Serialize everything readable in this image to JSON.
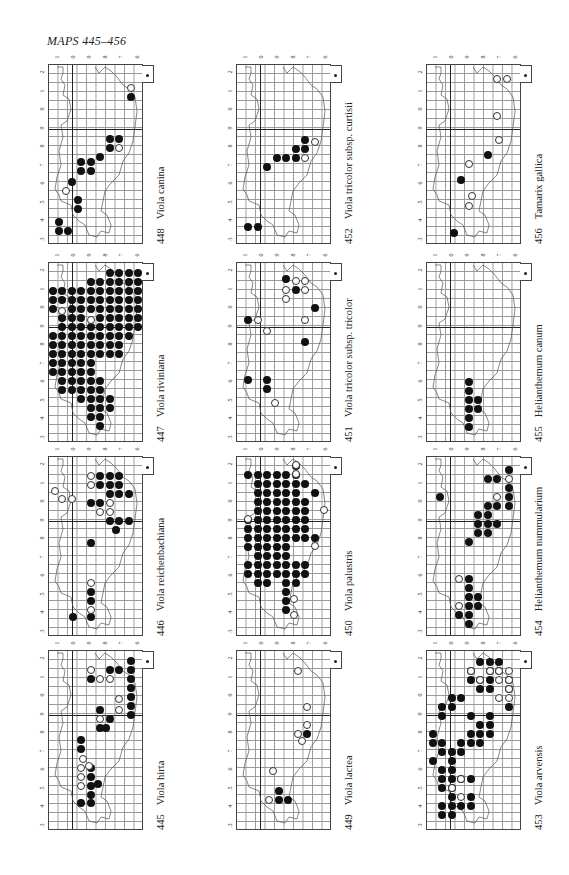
{
  "page": {
    "title": "MAPS 445–456",
    "background": "#ffffff",
    "dot_color": "#111111"
  },
  "axis_ticks": {
    "left": [
      "2",
      "1",
      "0",
      "9",
      "8",
      "7",
      "6",
      "5",
      "4",
      "3"
    ],
    "top": [
      "1",
      "0",
      "9",
      "8",
      "7",
      "6"
    ]
  },
  "legend": {
    "filled": "record present (filled circle)",
    "open": "older record (open circle)"
  },
  "maps": [
    {
      "number": "448",
      "species": "Viola canina",
      "col": 0,
      "row": 0,
      "filled": [
        [
          8.6,
          3.5
        ],
        [
          7.4,
          8.2
        ],
        [
          6.4,
          8.2
        ],
        [
          6.4,
          9.2
        ],
        [
          5.4,
          10.2
        ],
        [
          4.4,
          10.8
        ],
        [
          4.4,
          11.8
        ],
        [
          3.4,
          11.8
        ],
        [
          3.4,
          10.8
        ],
        [
          2.4,
          13.0
        ],
        [
          3.0,
          15.0
        ],
        [
          3.0,
          16.0
        ],
        [
          1.0,
          17.4
        ],
        [
          1.0,
          18.4
        ],
        [
          2.0,
          18.4
        ]
      ],
      "open": [
        [
          8.6,
          2.6
        ],
        [
          7.4,
          9.2
        ],
        [
          1.8,
          14.0
        ]
      ]
    },
    {
      "number": "447",
      "species": "Viola riviniana",
      "col": 0,
      "row": 1,
      "filled": "dense",
      "open": [
        [
          1.4,
          5.3
        ],
        [
          4.4,
          6.3
        ]
      ]
    },
    {
      "number": "446",
      "species": "Viola reichenbachiana",
      "col": 0,
      "row": 2,
      "filled": [
        [
          5.4,
          2.1
        ],
        [
          6.4,
          2.1
        ],
        [
          7.4,
          2.1
        ],
        [
          5.4,
          3.1
        ],
        [
          6.4,
          3.1
        ],
        [
          7.4,
          3.1
        ],
        [
          6.4,
          4.1
        ],
        [
          7.4,
          4.1
        ],
        [
          8.4,
          4.1
        ],
        [
          4.4,
          5.1
        ],
        [
          5.4,
          5.1
        ],
        [
          6.4,
          7.1
        ],
        [
          7.4,
          7.1
        ],
        [
          8.4,
          7.1
        ],
        [
          7.0,
          8.1
        ],
        [
          4.4,
          9.5
        ],
        [
          4.4,
          15.0
        ],
        [
          4.4,
          16.0
        ],
        [
          2.5,
          17.8
        ],
        [
          4.4,
          17.8
        ]
      ],
      "open": [
        [
          4.4,
          2.1
        ],
        [
          4.4,
          3.1
        ],
        [
          0.6,
          3.8
        ],
        [
          1.4,
          4.7
        ],
        [
          2.4,
          4.7
        ],
        [
          6.4,
          5.1
        ],
        [
          5.4,
          6.1
        ],
        [
          6.4,
          6.1
        ],
        [
          4.4,
          14.0
        ],
        [
          4.4,
          17.0
        ]
      ]
    },
    {
      "number": "445",
      "species": "Viola hirta",
      "col": 0,
      "row": 3,
      "filled": [
        [
          8.6,
          1.1
        ],
        [
          6.4,
          2.1
        ],
        [
          7.4,
          2.1
        ],
        [
          8.6,
          2.1
        ],
        [
          4.4,
          3.1
        ],
        [
          8.6,
          3.1
        ],
        [
          8.6,
          4.1
        ],
        [
          8.6,
          5.1
        ],
        [
          8.6,
          6.1
        ],
        [
          5.4,
          6.5
        ],
        [
          8.6,
          7.1
        ],
        [
          6.4,
          7.5
        ],
        [
          5.4,
          8.5
        ],
        [
          6.0,
          8.5
        ],
        [
          3.4,
          9.9
        ],
        [
          3.4,
          10.9
        ],
        [
          4.4,
          13.0
        ],
        [
          4.4,
          14.0
        ],
        [
          5.2,
          14.8
        ],
        [
          4.4,
          15.0
        ],
        [
          4.4,
          16.0
        ],
        [
          3.4,
          16.9
        ],
        [
          4.4,
          16.9
        ]
      ],
      "open": [
        [
          4.4,
          2.1
        ],
        [
          5.4,
          3.1
        ],
        [
          6.4,
          3.1
        ],
        [
          7.4,
          5.3
        ],
        [
          5.4,
          7.5
        ],
        [
          7.4,
          6.5
        ],
        [
          3.6,
          12.0
        ],
        [
          4.2,
          12.8
        ],
        [
          3.4,
          13.0
        ],
        [
          3.4,
          14.0
        ],
        [
          3.4,
          15.0
        ]
      ]
    },
    {
      "number": "452",
      "species": "Viola tricolor subsp. curtisii",
      "col": 1,
      "row": 0,
      "filled": [
        [
          7.2,
          8.3
        ],
        [
          6.2,
          9.3
        ],
        [
          7.2,
          9.3
        ],
        [
          5.2,
          10.3
        ],
        [
          6.2,
          10.3
        ],
        [
          4.2,
          10.3
        ],
        [
          3.2,
          11.3
        ],
        [
          1.2,
          18.0
        ],
        [
          2.2,
          18.0
        ]
      ],
      "open": [
        [
          8.2,
          8.5
        ],
        [
          7.2,
          10.3
        ]
      ]
    },
    {
      "number": "451",
      "species": "Viola tricolor subsp. tricolor",
      "col": 1,
      "row": 1,
      "filled": [
        [
          5.2,
          1.8
        ],
        [
          6.2,
          3.0
        ],
        [
          8.2,
          5.0
        ],
        [
          1.2,
          6.3
        ],
        [
          7.2,
          8.8
        ],
        [
          1.2,
          13.0
        ],
        [
          3.2,
          13.0
        ],
        [
          3.2,
          14.0
        ]
      ],
      "open": [
        [
          6.2,
          2.0
        ],
        [
          7.2,
          2.0
        ],
        [
          5.2,
          3.0
        ],
        [
          7.2,
          3.0
        ],
        [
          5.2,
          4.0
        ],
        [
          2.2,
          6.3
        ],
        [
          7.2,
          6.3
        ],
        [
          3.2,
          7.5
        ],
        [
          4.0,
          15.5
        ]
      ]
    },
    {
      "number": "450",
      "species": "Viola palustris",
      "col": 1,
      "row": 2,
      "filled": "dense",
      "open": [
        [
          6.2,
          0.9
        ],
        [
          6.2,
          1.9
        ],
        [
          9.2,
          5.9
        ],
        [
          1.2,
          6.9
        ],
        [
          8.2,
          9.9
        ],
        [
          6.0,
          15.8
        ],
        [
          6.0,
          17.6
        ]
      ]
    },
    {
      "number": "449",
      "species": "Viola lactea",
      "col": 1,
      "row": 3,
      "filled": [
        [
          7.4,
          9.2
        ],
        [
          4.4,
          15.5
        ],
        [
          4.4,
          16.5
        ],
        [
          5.4,
          16.5
        ]
      ],
      "open": [
        [
          6.4,
          2.2
        ],
        [
          7.4,
          6.2
        ],
        [
          7.4,
          8.2
        ],
        [
          6.4,
          9.2
        ],
        [
          6.8,
          10.0
        ],
        [
          3.8,
          13.3
        ],
        [
          3.4,
          16.5
        ]
      ]
    },
    {
      "number": "456",
      "species": "Tamarix gallica",
      "col": 2,
      "row": 0,
      "filled": [
        [
          6.4,
          10.0
        ],
        [
          3.6,
          12.8
        ],
        [
          2.8,
          18.7
        ]
      ],
      "open": [
        [
          7.4,
          1.6
        ],
        [
          8.4,
          1.6
        ],
        [
          7.4,
          5.7
        ],
        [
          7.6,
          8.3
        ],
        [
          4.4,
          11.0
        ],
        [
          4.7,
          14.5
        ],
        [
          4.4,
          15.7
        ]
      ]
    },
    {
      "number": "455",
      "species": "Helianthemum canum",
      "col": 2,
      "row": 1,
      "filled": [
        [
          4.4,
          13.2
        ],
        [
          4.4,
          14.2
        ],
        [
          4.4,
          15.2
        ],
        [
          5.4,
          15.2
        ],
        [
          4.4,
          16.2
        ],
        [
          5.4,
          16.2
        ],
        [
          4.4,
          17.2
        ],
        [
          4.4,
          18.2
        ]
      ],
      "open": []
    },
    {
      "number": "454",
      "species": "Helianthemum nummularium",
      "col": 2,
      "row": 2,
      "filled": [
        [
          8.6,
          1.4
        ],
        [
          6.4,
          2.4
        ],
        [
          7.4,
          2.4
        ],
        [
          8.6,
          3.4
        ],
        [
          1.4,
          4.4
        ],
        [
          8.6,
          4.4
        ],
        [
          6.4,
          5.4
        ],
        [
          7.4,
          5.4
        ],
        [
          8.6,
          5.4
        ],
        [
          5.4,
          6.4
        ],
        [
          6.4,
          6.4
        ],
        [
          5.4,
          7.4
        ],
        [
          6.4,
          7.4
        ],
        [
          7.4,
          7.4
        ],
        [
          5.4,
          8.4
        ],
        [
          6.4,
          8.4
        ],
        [
          4.4,
          9.4
        ],
        [
          4.4,
          13.5
        ],
        [
          4.4,
          14.5
        ],
        [
          4.4,
          15.5
        ],
        [
          5.4,
          15.5
        ],
        [
          4.4,
          16.5
        ],
        [
          5.4,
          16.5
        ],
        [
          3.4,
          17.5
        ],
        [
          4.4,
          17.5
        ],
        [
          4.4,
          18.5
        ]
      ],
      "open": [
        [
          8.6,
          2.4
        ],
        [
          7.4,
          4.4
        ],
        [
          3.4,
          13.5
        ],
        [
          3.4,
          16.5
        ]
      ]
    },
    {
      "number": "453",
      "species": "Viola arvensis",
      "col": 2,
      "row": 3,
      "filled": "mixed",
      "open": []
    }
  ]
}
